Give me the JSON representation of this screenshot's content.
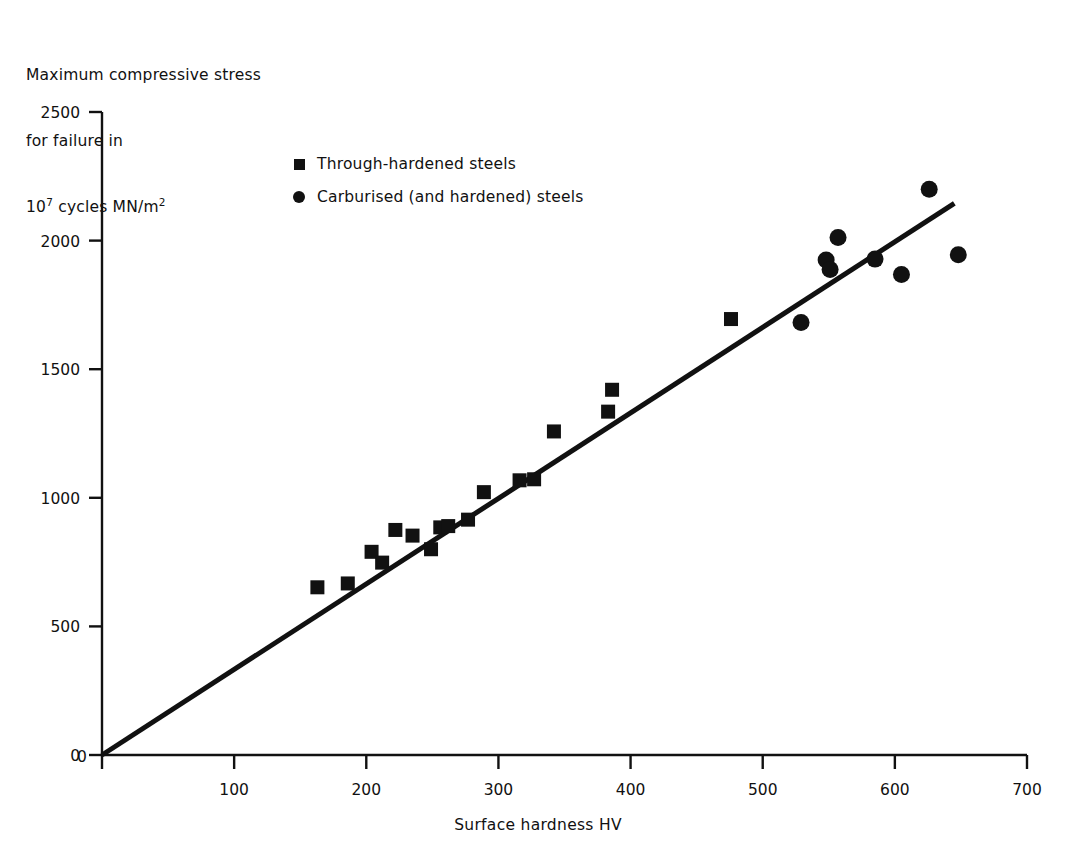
{
  "axes": {
    "ylabel_lines": [
      "Maximum compressive stress",
      "for failure in",
      "cycles MN/m"
    ],
    "ylabel_base": "10",
    "ylabel_exp": "7",
    "ylabel_unit_exp": "2",
    "xlabel": "Surface hardness HV",
    "yticks": [
      "0",
      "500",
      "1000",
      "1500",
      "2000",
      "2500"
    ],
    "xticks": [
      "0",
      "100",
      "200",
      "300",
      "400",
      "500",
      "600",
      "700"
    ]
  },
  "legend": {
    "items": [
      {
        "marker": "square-marker",
        "label": "Through-hardened steels"
      },
      {
        "marker": "circle-marker",
        "label": "Carburised (and hardened) steels"
      }
    ]
  },
  "colors": {
    "ink": "#111111",
    "background": "#ffffff"
  },
  "chart_data": {
    "type": "scatter",
    "title": "",
    "xlabel": "Surface hardness HV",
    "ylabel": "Maximum compressive stress for failure in 10^7 cycles MN/m^2",
    "xlim": [
      0,
      700
    ],
    "ylim": [
      0,
      2500
    ],
    "xticks": [
      0,
      100,
      200,
      300,
      400,
      500,
      600,
      700
    ],
    "yticks": [
      0,
      500,
      1000,
      1500,
      2000,
      2500
    ],
    "grid": false,
    "legend_position": "upper-left-inside",
    "series": [
      {
        "name": "Through-hardened steels",
        "marker": "square",
        "points": [
          [
            163,
            652
          ],
          [
            186,
            667
          ],
          [
            204,
            790
          ],
          [
            212,
            748
          ],
          [
            222,
            875
          ],
          [
            235,
            853
          ],
          [
            249,
            800
          ],
          [
            256,
            885
          ],
          [
            262,
            890
          ],
          [
            277,
            915
          ],
          [
            289,
            1022
          ],
          [
            316,
            1068
          ],
          [
            327,
            1072
          ],
          [
            342,
            1258
          ],
          [
            383,
            1335
          ],
          [
            386,
            1420
          ],
          [
            476,
            1695
          ]
        ]
      },
      {
        "name": "Carburised (and hardened) steels",
        "marker": "circle",
        "points": [
          [
            529,
            1682
          ],
          [
            548,
            1925
          ],
          [
            551,
            1888
          ],
          [
            557,
            2012
          ],
          [
            585,
            1928
          ],
          [
            605,
            1868
          ],
          [
            626,
            2200
          ],
          [
            648,
            1945
          ]
        ]
      }
    ],
    "trendline": {
      "x": [
        0,
        645
      ],
      "y": [
        0,
        2145
      ],
      "style": "solid"
    }
  }
}
